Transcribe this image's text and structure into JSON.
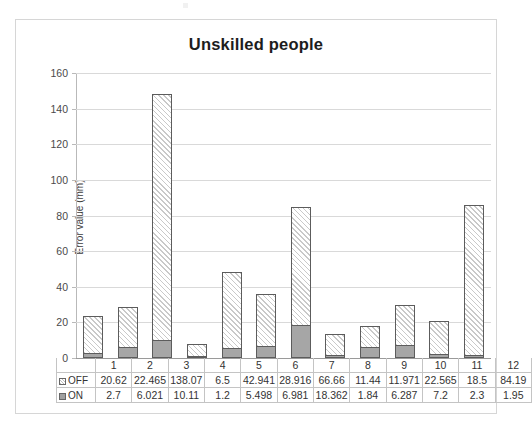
{
  "chart_data": {
    "type": "bar",
    "subtype": "stacked-column",
    "title": "Unskilled people",
    "xlabel": "",
    "ylabel": "Error value (mm)",
    "ylim": [
      0,
      160
    ],
    "y_ticks": [
      0,
      20,
      40,
      60,
      80,
      100,
      120,
      140,
      160
    ],
    "grid": true,
    "legend_position": "data-table",
    "categories": [
      "1",
      "2",
      "3",
      "4",
      "5",
      "6",
      "7",
      "8",
      "9",
      "10",
      "11",
      "12"
    ],
    "series": [
      {
        "name": "OFF",
        "values": [
          20.62,
          22.465,
          138.07,
          6.5,
          42.941,
          28.916,
          66.66,
          11.44,
          11.971,
          22.565,
          18.5,
          84.19
        ],
        "swatch": "hatched-square",
        "color": "#ffffff",
        "hatch_color": "#c9c9c9"
      },
      {
        "name": "ON",
        "values": [
          2.7,
          6.021,
          10.11,
          1.2,
          5.498,
          6.981,
          18.362,
          1.84,
          6.287,
          7.2,
          2.3,
          1.95
        ],
        "swatch": "filled-square",
        "color": "#a6a6a6"
      }
    ],
    "totals": [
      23.32,
      28.486,
      148.18,
      7.7,
      48.439,
      35.897,
      85.022,
      13.28,
      18.258,
      29.765,
      20.8,
      86.14
    ]
  }
}
